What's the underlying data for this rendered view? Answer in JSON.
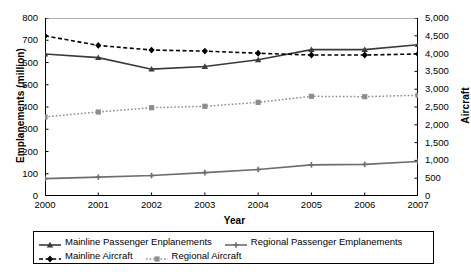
{
  "chart_data": {
    "type": "line",
    "title": "",
    "xlabel": "Year",
    "ylabel": "Emplanements (million)",
    "y2label": "Aircraft",
    "categories": [
      "2000",
      "2001",
      "2002",
      "2003",
      "2004",
      "2005",
      "2006",
      "2007"
    ],
    "ylim": [
      0,
      800
    ],
    "y2lim": [
      0,
      5000
    ],
    "yticks": [
      "0",
      "100",
      "200",
      "300",
      "400",
      "500",
      "600",
      "700",
      "800"
    ],
    "y2ticks": [
      "0",
      "500",
      "1,000",
      "1,500",
      "2,000",
      "2,500",
      "3,000",
      "3,500",
      "4,000",
      "4,500",
      "5,000"
    ],
    "grid": false,
    "legend_position": "bottom",
    "series": [
      {
        "name": "Mainline Passenger Enplanements",
        "axis": "left",
        "style": "solid",
        "color": "#3a3a3a",
        "marker": "triangle",
        "values": [
          638,
          622,
          570,
          582,
          612,
          658,
          658,
          680
        ]
      },
      {
        "name": "Regional Passenger Emplanements",
        "axis": "left",
        "style": "solid",
        "color": "#6e6e6e",
        "marker": "plus",
        "values": [
          78,
          85,
          92,
          105,
          119,
          140,
          142,
          155
        ]
      },
      {
        "name": "Mainline Aircraft",
        "axis": "right",
        "style": "dashed",
        "color": "#000000",
        "marker": "diamond",
        "values": [
          4500,
          4230,
          4100,
          4070,
          4010,
          3960,
          3960,
          3990
        ]
      },
      {
        "name": "Regional Aircraft",
        "axis": "right",
        "style": "dotted",
        "color": "#8d8d8d",
        "marker": "square",
        "values": [
          2220,
          2360,
          2480,
          2520,
          2630,
          2800,
          2790,
          2830
        ]
      }
    ]
  },
  "axes": {
    "left_title": "Emplanements (million)",
    "right_title": "Aircraft",
    "x_title": "Year"
  },
  "legend": {
    "items": [
      {
        "label": "Mainline Passenger Enplanements"
      },
      {
        "label": "Regional Passenger Emplanements"
      },
      {
        "label": "Mainline Aircraft"
      },
      {
        "label": "Regional Aircraft"
      }
    ]
  },
  "colors": {
    "mainline_enplanements": "#3a3a3a",
    "regional_enplanements": "#6e6e6e",
    "mainline_aircraft": "#000000",
    "regional_aircraft": "#8d8d8d",
    "axis": "#000000",
    "gridline": "#b3b3b3"
  }
}
